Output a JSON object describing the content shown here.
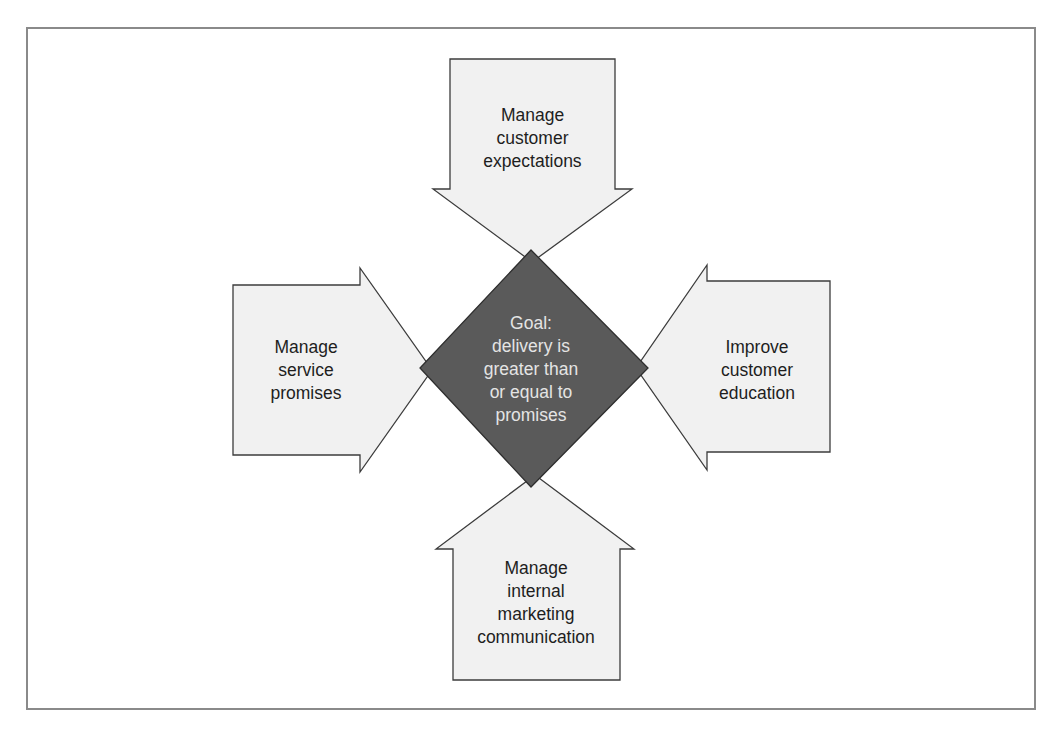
{
  "diagram": {
    "type": "convergent-arrows",
    "goal": {
      "lines": [
        "Goal:",
        "delivery is",
        "greater than",
        "or equal to",
        "promises"
      ],
      "fill": "#5a5a5a",
      "text_color": "#e4e4e4"
    },
    "arrows": [
      {
        "id": "top",
        "direction": "down",
        "lines": [
          "Manage",
          "customer",
          "expectations"
        ]
      },
      {
        "id": "left",
        "direction": "right",
        "lines": [
          "Manage",
          "service",
          "promises"
        ]
      },
      {
        "id": "right",
        "direction": "left",
        "lines": [
          "Improve",
          "customer",
          "education"
        ]
      },
      {
        "id": "bottom",
        "direction": "up",
        "lines": [
          "Manage",
          "internal",
          "marketing",
          "communication"
        ]
      }
    ],
    "colors": {
      "arrow_fill": "#f1f1f1",
      "outline": "#3c3c3c",
      "frame": "#8a8a8a"
    }
  }
}
